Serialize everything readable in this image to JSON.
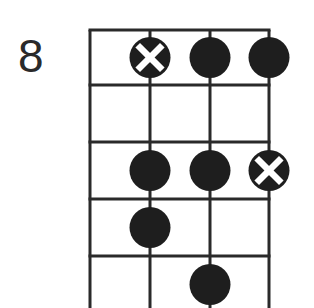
{
  "diagram": {
    "type": "fretboard-scale-box",
    "starting_fret_label": "8",
    "strings": 4,
    "frets_shown": 5,
    "colors": {
      "line": "#2a2a2a",
      "dot": "#1e1e1e",
      "root_mark": "#ffffff"
    },
    "notes": [
      {
        "string": 2,
        "fret_row": 1,
        "root": true
      },
      {
        "string": 3,
        "fret_row": 1,
        "root": false
      },
      {
        "string": 4,
        "fret_row": 1,
        "root": false
      },
      {
        "string": 2,
        "fret_row": 3,
        "root": false
      },
      {
        "string": 3,
        "fret_row": 3,
        "root": false
      },
      {
        "string": 4,
        "fret_row": 3,
        "root": true
      },
      {
        "string": 2,
        "fret_row": 4,
        "root": false
      },
      {
        "string": 3,
        "fret_row": 5,
        "root": false
      }
    ]
  }
}
